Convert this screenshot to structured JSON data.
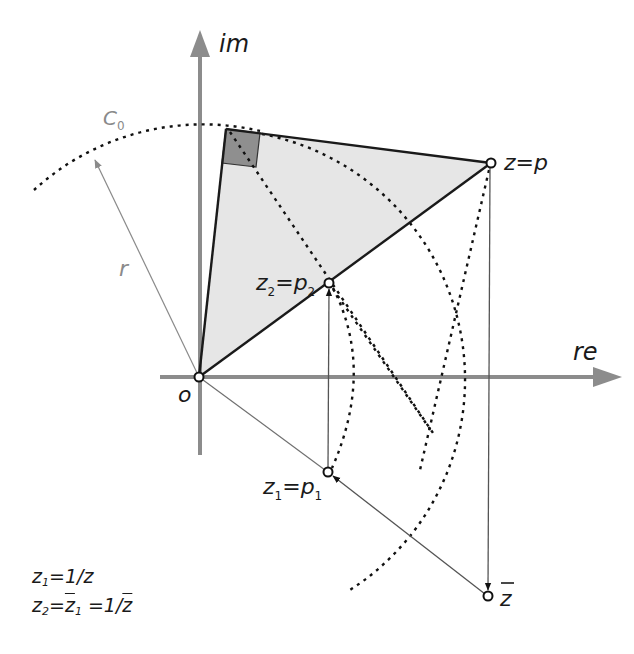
{
  "diagram": {
    "axes": {
      "x_label": "re",
      "y_label": "im",
      "color": "#8c8c8c"
    },
    "origin_label": "o",
    "circle_label": "C",
    "circle_label_sub": "0",
    "radius_label": "r",
    "points": {
      "z": {
        "label": "z=p"
      },
      "z2": {
        "label_main": "z",
        "label_sub": "2",
        "label_eq": "=p",
        "label_sub2": "2"
      },
      "z1": {
        "label_main": "z",
        "label_sub": "1",
        "label_eq": "=p",
        "label_sub2": "1"
      },
      "zbar": {
        "label": "z"
      }
    },
    "colors": {
      "triangle_fill": "#e6e6e6",
      "right_angle_fill": "#8f8f8f",
      "line": "#1a1a1a",
      "thin_line": "#707070",
      "axis": "#8c8c8c"
    },
    "formulas": [
      {
        "lhs": "z",
        "lhs_sub": "1",
        "rhs": "=1/z"
      },
      {
        "lhs": "z",
        "lhs_sub": "2",
        "mid": "=",
        "mid_bar": "z",
        "mid_sub": "1",
        "rhs": " =1/",
        "rhs_bar": "z"
      }
    ]
  }
}
